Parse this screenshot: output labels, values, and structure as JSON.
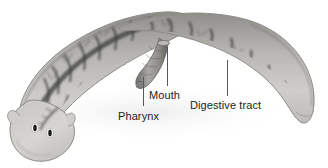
{
  "figure": {
    "style": "grayscale scientific illustration",
    "background_color": "#ffffff",
    "label_color": "#1d1d1d",
    "leader_line_color": "#55585c",
    "body_fill_light": "#d3d2cf",
    "body_fill_mid": "#a7a6a3",
    "body_outline": "#8e8d8a",
    "gut_dark": "#4a4a4a",
    "gut_darkest": "#2f2f2f",
    "eyespot_color": "#1a1a1a",
    "width": 328,
    "height": 168
  },
  "labels": [
    {
      "id": "pharynx",
      "text": "Pharynx",
      "x": 118,
      "y": 110,
      "leader": {
        "x1": 143,
        "y1": 106,
        "x2": 143,
        "y2": 76
      }
    },
    {
      "id": "mouth",
      "text": "Mouth",
      "x": 149,
      "y": 89,
      "leader": {
        "x1": 167,
        "y1": 86,
        "x2": 167,
        "y2": 47
      }
    },
    {
      "id": "digestive-tract",
      "text": "Digestive tract",
      "x": 190,
      "y": 99,
      "leader": {
        "x1": 227,
        "y1": 96,
        "x2": 227,
        "y2": 60
      }
    }
  ],
  "anatomy": {
    "eyespots_count": 2,
    "parts": [
      "head",
      "eyespots",
      "pharynx",
      "mouth",
      "digestive tract",
      "tail"
    ]
  }
}
